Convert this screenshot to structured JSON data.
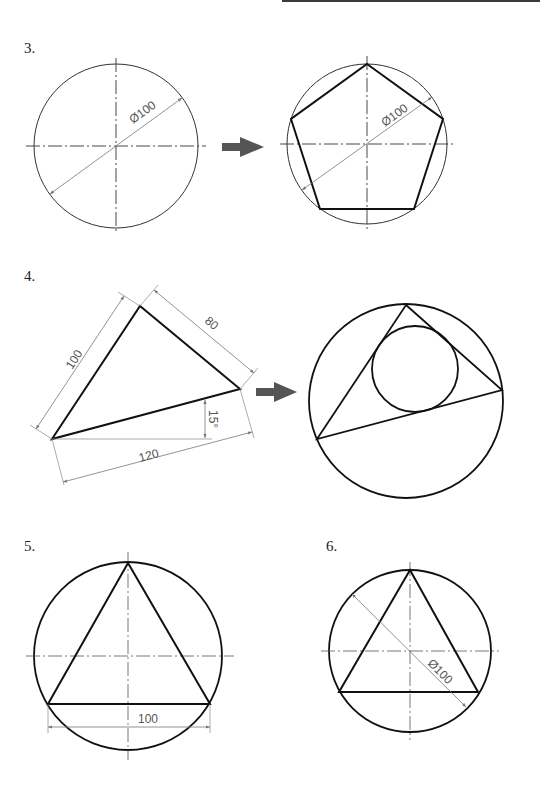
{
  "page": {
    "colors": {
      "thick_line": "#111111",
      "thin_line": "#333333",
      "dim_line": "#777777",
      "arrow_fill": "#555555",
      "top_bar": "#3a3a3a"
    }
  },
  "problems": [
    {
      "number": "3.",
      "before": {
        "shape": "circle",
        "dimension": "Ø100"
      },
      "after": {
        "shape": "regular pentagon inscribed in circle",
        "dimension": "Ø100"
      }
    },
    {
      "number": "4.",
      "before": {
        "shape": "triangle",
        "dimensions": [
          "100",
          "80",
          "120",
          "15°"
        ]
      },
      "after": {
        "shape": "triangle with circumscribed and inscribed circles"
      }
    },
    {
      "number": "5.",
      "shape": "equilateral triangle inscribed in circle",
      "dimension": "100"
    },
    {
      "number": "6.",
      "shape": "equilateral triangle inscribed in circle",
      "dimension": "Ø100"
    }
  ]
}
